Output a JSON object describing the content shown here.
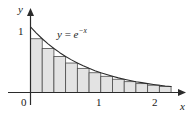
{
  "figure": {
    "name": "riemann-sum-exponential-decay",
    "background_color": "#ffffff",
    "ink_color": "#1a1a1a",
    "bar_fill_color": "#e3e3e3",
    "bar_stroke_color": "#4d4d4d"
  },
  "labels": {
    "y_axis": "y",
    "x_axis": "x",
    "origin": "0",
    "y_one": "1",
    "x_one": "1",
    "x_two": "2",
    "curve_prefix": "y",
    "curve_equals": "=",
    "curve_base": "e",
    "curve_exponent": "−x"
  },
  "chart_data": {
    "type": "area",
    "title": "",
    "subtitle": "",
    "xlabel": "x",
    "ylabel": "y",
    "xlim": [
      0,
      2.45
    ],
    "ylim": [
      0,
      1.12
    ],
    "grid": false,
    "legend": null,
    "annotations": [
      {
        "text": "y = e^(-x)",
        "x": 0.55,
        "y": 0.92
      }
    ],
    "xticks": [
      0,
      1,
      2
    ],
    "xtick_labels": [
      "0",
      "1",
      "2"
    ],
    "yticks": [
      1
    ],
    "ytick_labels": [
      "1"
    ],
    "series": [
      {
        "name": "y = e^{-x}",
        "kind": "line",
        "x": [
          0,
          0.1,
          0.2,
          0.3,
          0.4,
          0.5,
          0.6,
          0.7,
          0.8,
          0.9,
          1.0,
          1.1,
          1.2,
          1.3,
          1.4,
          1.5,
          1.6,
          1.7,
          1.8,
          1.9,
          2.0,
          2.1,
          2.2,
          2.3,
          2.4
        ],
        "values": [
          1.0,
          0.905,
          0.819,
          0.741,
          0.67,
          0.607,
          0.549,
          0.497,
          0.449,
          0.407,
          0.368,
          0.333,
          0.301,
          0.273,
          0.247,
          0.223,
          0.202,
          0.183,
          0.165,
          0.15,
          0.135,
          0.122,
          0.111,
          0.1,
          0.091
        ]
      },
      {
        "name": "right-endpoint rectangles",
        "kind": "bar",
        "bar_width": 0.2,
        "left_edges": [
          0.0,
          0.2,
          0.4,
          0.6,
          0.8,
          1.0,
          1.2,
          1.4,
          1.6,
          1.8,
          2.0,
          2.2
        ],
        "values": [
          0.819,
          0.67,
          0.549,
          0.449,
          0.368,
          0.301,
          0.247,
          0.202,
          0.165,
          0.135,
          0.111,
          0.091
        ]
      }
    ]
  }
}
